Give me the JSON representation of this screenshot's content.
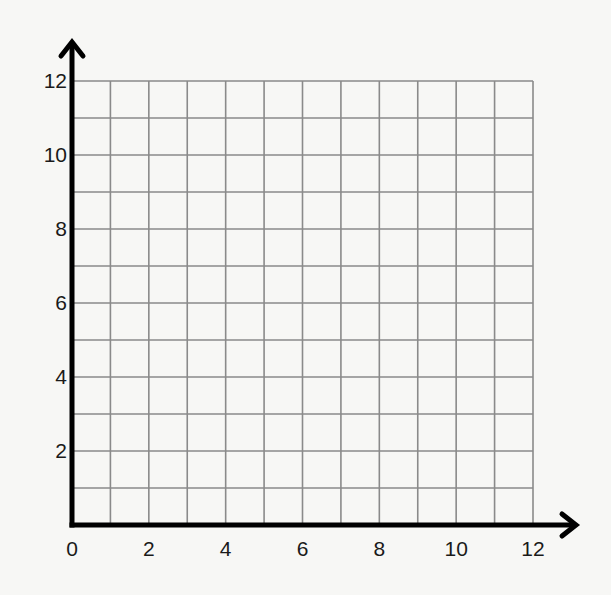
{
  "chart_data": {
    "type": "scatter",
    "title": "",
    "xlabel": "",
    "ylabel": "",
    "xlim": [
      0,
      12
    ],
    "ylim": [
      0,
      12
    ],
    "grid": true,
    "grid_step": 1,
    "x_ticks": [
      0,
      2,
      4,
      6,
      8,
      10,
      12
    ],
    "y_ticks": [
      2,
      4,
      6,
      8,
      10,
      12
    ],
    "x_tick_labels": [
      "0",
      "2",
      "4",
      "6",
      "8",
      "10",
      "12"
    ],
    "y_tick_labels": [
      "2",
      "4",
      "6",
      "8",
      "10",
      "12"
    ],
    "series": [],
    "legend": null,
    "axis_arrows": true
  },
  "colors": {
    "background": "#f7f7f5",
    "grid": "#8a8a8a",
    "axis": "#000000",
    "label": "#1a1a1a"
  },
  "layout": {
    "origin_px": [
      72,
      525
    ],
    "x_end_px": 533,
    "y_end_px": 81,
    "x_arrow_tip_px": 578,
    "y_arrow_tip_px": 40
  }
}
